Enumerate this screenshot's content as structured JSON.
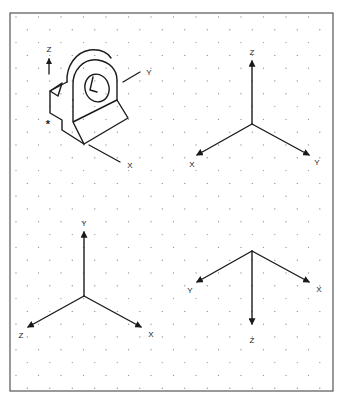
{
  "sheet": {
    "title": "Isometric axis orientation worksheet",
    "background": "#ffffff",
    "border_color": "#555555",
    "line_color": "#1a1a1a",
    "dot_color": "#9a9a9a",
    "frame": {
      "x": 10,
      "y": 13,
      "width": 323,
      "height": 378
    },
    "dot_grid": {
      "dx": 22.5,
      "dy": 12.8,
      "x0": 16,
      "y0": 17
    }
  },
  "figures": [
    {
      "id": "object-view",
      "description": "Isometric pillow-block object with hole, reference corner marked *",
      "marker": "*",
      "axes": [
        {
          "label": "Z",
          "direction": "up"
        },
        {
          "label": "Y",
          "direction": "right-up"
        },
        {
          "label": "X",
          "direction": "right-down"
        }
      ]
    },
    {
      "id": "triad-top-right",
      "origin": [
        252,
        124
      ],
      "axes": [
        {
          "label": "Z",
          "tip": [
            252,
            60
          ],
          "label_pos": [
            252,
            52
          ]
        },
        {
          "label": "X",
          "tip": [
            196,
            155
          ],
          "label_pos": [
            192,
            165
          ]
        },
        {
          "label": "Y",
          "tip": [
            310,
            155
          ],
          "label_pos": [
            317,
            163
          ]
        }
      ]
    },
    {
      "id": "triad-bottom-left",
      "origin": [
        84,
        296
      ],
      "axes": [
        {
          "label": "Y",
          "tip": [
            84,
            231
          ],
          "label_pos": [
            84,
            225
          ]
        },
        {
          "label": "Z",
          "tip": [
            27,
            327
          ],
          "label_pos": [
            21,
            336
          ]
        },
        {
          "label": "X",
          "tip": [
            142,
            327
          ],
          "label_pos": [
            151,
            335
          ]
        }
      ]
    },
    {
      "id": "triad-bottom-right",
      "origin": [
        252,
        251
      ],
      "axes": [
        {
          "label": "Y",
          "tip": [
            196,
            282
          ],
          "label_pos": [
            190,
            291
          ]
        },
        {
          "label": "X",
          "tip": [
            310,
            282
          ],
          "label_pos": [
            319,
            290
          ]
        },
        {
          "label": "Z",
          "tip": [
            252,
            325
          ],
          "label_pos": [
            252,
            341
          ]
        }
      ]
    }
  ],
  "object_labels": {
    "z": "Z",
    "y": "Y",
    "x": "X",
    "marker": "*"
  },
  "labels": {
    "tr_z": "Z",
    "tr_x": "X",
    "tr_y": "Y",
    "bl_y": "Y",
    "bl_z": "Z",
    "bl_x": "X",
    "br_y": "Y",
    "br_x": "X",
    "br_z": "Z"
  }
}
